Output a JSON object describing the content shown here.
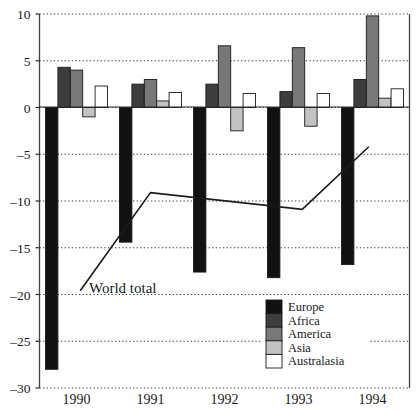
{
  "chart_data": {
    "type": "bar",
    "title": "",
    "subtitle": "",
    "xlabel": "",
    "ylabel": "",
    "categories": [
      "1990",
      "1991",
      "1992",
      "1993",
      "1994"
    ],
    "ylim": [
      -30,
      10
    ],
    "yticks": [
      10,
      5,
      0,
      -5,
      -10,
      -15,
      -20,
      -25,
      -30
    ],
    "ytick_labels": [
      "10",
      "5",
      "0",
      "–5",
      "–10",
      "–15",
      "–20",
      "–25",
      "–30"
    ],
    "grid": true,
    "legend_position": "inside-bottom-right",
    "series": [
      {
        "name": "Europe",
        "color": "#121212",
        "values": [
          -28.0,
          -14.4,
          -17.6,
          -18.2,
          -16.8
        ]
      },
      {
        "name": "Africa",
        "color": "#3d3d3d",
        "values": [
          4.3,
          2.5,
          2.5,
          1.7,
          3.0
        ]
      },
      {
        "name": "America",
        "color": "#787878",
        "values": [
          4.0,
          3.0,
          6.6,
          6.4,
          9.8
        ]
      },
      {
        "name": "Asia",
        "color": "#c2c2c2",
        "values": [
          -1.0,
          0.7,
          -2.5,
          -2.0,
          1.0
        ]
      },
      {
        "name": "Australasia",
        "color": "#ffffff",
        "values": [
          2.3,
          1.6,
          1.5,
          1.5,
          2.0
        ]
      }
    ],
    "annotations": [
      {
        "label": "World total",
        "type": "line",
        "color": "#1a1a1a",
        "points": [
          {
            "x": 1990.05,
            "y": -19.6
          },
          {
            "x": 1991.0,
            "y": -9.1
          },
          {
            "x": 1993.05,
            "y": -10.9
          },
          {
            "x": 1993.95,
            "y": -4.2
          }
        ]
      }
    ]
  },
  "legend": {
    "items": [
      {
        "label": "Europe",
        "color": "#121212"
      },
      {
        "label": "Africa",
        "color": "#3d3d3d"
      },
      {
        "label": "America",
        "color": "#787878"
      },
      {
        "label": "Asia",
        "color": "#c2c2c2"
      },
      {
        "label": "Australasia",
        "color": "#ffffff"
      }
    ]
  },
  "annotation_text": {
    "world_total": "World total"
  }
}
